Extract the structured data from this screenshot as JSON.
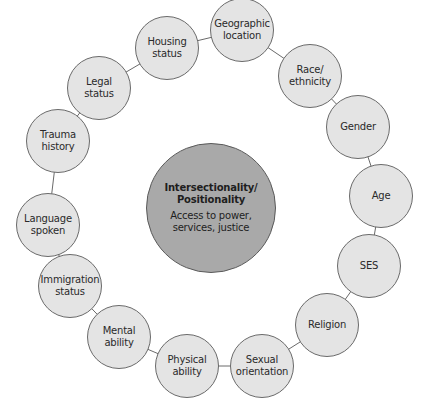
{
  "center": {
    "title": "Intersectionality/\nPositionality",
    "subtitle": "Access to power,\nservices, justice",
    "color": "#a9a9a9"
  },
  "node_color": "#e4e4e4",
  "nodes": [
    {
      "label": "Housing\nstatus"
    },
    {
      "label": "Geographic\nlocation"
    },
    {
      "label": "Race/\nethnicity"
    },
    {
      "label": "Gender"
    },
    {
      "label": "Age"
    },
    {
      "label": "SES"
    },
    {
      "label": "Religion"
    },
    {
      "label": "Sexual\norientation"
    },
    {
      "label": "Physical\nability"
    },
    {
      "label": "Mental\nability"
    },
    {
      "label": "Immigration\nstatus"
    },
    {
      "label": "Language\nspoken"
    },
    {
      "label": "Trauma\nhistory"
    },
    {
      "label": "Legal\nstatus"
    }
  ]
}
